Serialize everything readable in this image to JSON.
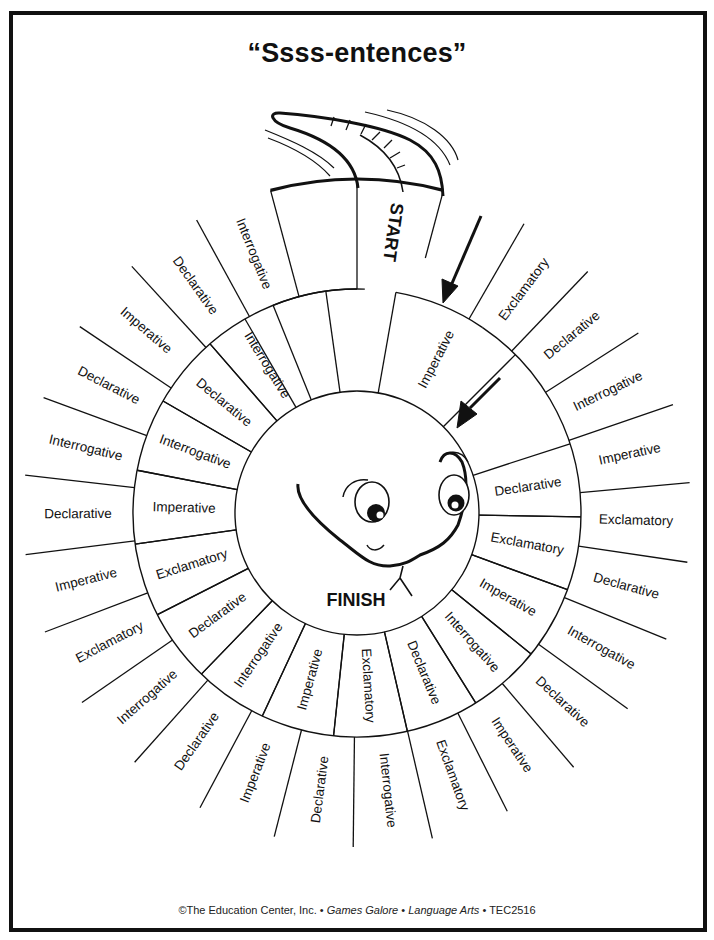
{
  "title": "“Ssss-entences”",
  "footer": {
    "copyright": "©The Education Center, Inc.",
    "sep1": " • ",
    "book": "Games Galore",
    "sep2": " • ",
    "subject": "Language Arts",
    "sep3": " • ",
    "code": "TEC2516"
  },
  "board": {
    "start_label": "START",
    "finish_label": "FINISH",
    "outer_ring": [
      "Exclamatory",
      "Declarative",
      "Interrogative",
      "Imperative",
      "Exclamatory",
      "Declarative",
      "Interrogative",
      "Declarative",
      "Imperative",
      "Exclamatory",
      "Interrogative",
      "Declarative",
      "Imperative",
      "Declarative",
      "Interrogative",
      "Exclamatory",
      "Imperative",
      "Declarative",
      "Interrogative",
      "Declarative",
      "Imperative",
      "Declarative",
      "Interrogative"
    ],
    "middle_ring": [
      "Imperative",
      "Declarative",
      "Exclamatory",
      "Imperative",
      "Interrogative",
      "Declarative",
      "Exclamatory",
      "Imperative",
      "Interrogative",
      "Declarative",
      "Exclamatory",
      "Imperative",
      "Interrogative",
      "Declarative",
      "Interrogative"
    ],
    "icons": [
      "snake-tail-icon",
      "arrow-icon",
      "snake-head-icon"
    ]
  }
}
